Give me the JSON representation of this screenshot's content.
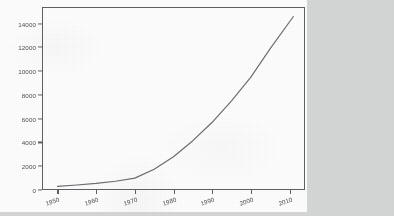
{
  "page": {
    "background_color": "#d5d6d6",
    "paper_color": "#fdfdfd"
  },
  "chart_data": {
    "type": "line",
    "title": "",
    "subtitle": "",
    "xlabel": "",
    "ylabel": "",
    "legend": [],
    "grid": false,
    "line_color": "#6a6d70",
    "axis_color": "#5e6163",
    "xlim": [
      1946,
      2014
    ],
    "ylim": [
      0,
      15400
    ],
    "xticks": [
      1950,
      1960,
      1970,
      1980,
      1990,
      2000,
      2010
    ],
    "xtick_labels": [
      "1950",
      "1960",
      "1970",
      "1980",
      "1990",
      "2000",
      "2010"
    ],
    "yticks": [
      0,
      2000,
      4000,
      6000,
      8000,
      10000,
      12000,
      14000
    ],
    "ytick_labels": [
      "0",
      "2000",
      "4000",
      "6000",
      "8000",
      "10000",
      "12000",
      "14000"
    ],
    "series": [
      {
        "name": "value",
        "x": [
          1950,
          1955,
          1960,
          1965,
          1970,
          1975,
          1980,
          1985,
          1990,
          1995,
          2000,
          2005,
          2011
        ],
        "values": [
          300,
          420,
          560,
          740,
          1000,
          1750,
          2800,
          4150,
          5700,
          7500,
          9500,
          11900,
          14600
        ]
      }
    ]
  }
}
